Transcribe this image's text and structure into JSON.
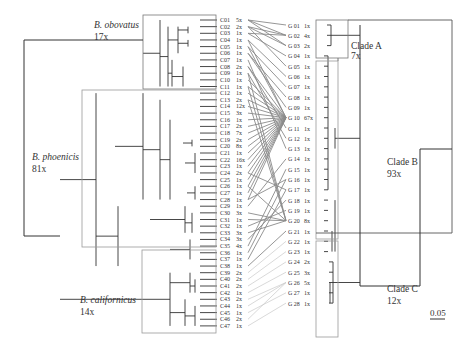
{
  "groups": {
    "obovatus": {
      "name": "B. obovatus",
      "count": "17x"
    },
    "phoenicis": {
      "name": "B. phoenicis",
      "count": "81x"
    },
    "californicus": {
      "name": "B. californicus",
      "count": "14x"
    }
  },
  "clades": {
    "A": {
      "name": "Clade A",
      "count": "7x"
    },
    "B": {
      "name": "Clade B",
      "count": "93x"
    },
    "C": {
      "name": "Clade C",
      "count": "12x"
    }
  },
  "scale_bar": "0.05",
  "c_taxa": [
    {
      "id": "C01",
      "n": "5x"
    },
    {
      "id": "C02",
      "n": "2x"
    },
    {
      "id": "C03",
      "n": "1x"
    },
    {
      "id": "C04",
      "n": "1x"
    },
    {
      "id": "C05",
      "n": "1x"
    },
    {
      "id": "C06",
      "n": "1x"
    },
    {
      "id": "C07",
      "n": "1x"
    },
    {
      "id": "C08",
      "n": "2x"
    },
    {
      "id": "C09",
      "n": "1x"
    },
    {
      "id": "C10",
      "n": "1x"
    },
    {
      "id": "C11",
      "n": "1x"
    },
    {
      "id": "C12",
      "n": "1x"
    },
    {
      "id": "C13",
      "n": "2x"
    },
    {
      "id": "C14",
      "n": "12x"
    },
    {
      "id": "C15",
      "n": "3x"
    },
    {
      "id": "C16",
      "n": "1x"
    },
    {
      "id": "C17",
      "n": "2x"
    },
    {
      "id": "C18",
      "n": "7x"
    },
    {
      "id": "C19",
      "n": "2x"
    },
    {
      "id": "C20",
      "n": "8x"
    },
    {
      "id": "C21",
      "n": "1x"
    },
    {
      "id": "C22",
      "n": "16x"
    },
    {
      "id": "C23",
      "n": "1x"
    },
    {
      "id": "C24",
      "n": "2x"
    },
    {
      "id": "C25",
      "n": "1x"
    },
    {
      "id": "C26",
      "n": "1x"
    },
    {
      "id": "C27",
      "n": "1x"
    },
    {
      "id": "C28",
      "n": "1x"
    },
    {
      "id": "C29",
      "n": "1x"
    },
    {
      "id": "C30",
      "n": "3x"
    },
    {
      "id": "C31",
      "n": "1x"
    },
    {
      "id": "C32",
      "n": "1x"
    },
    {
      "id": "C33",
      "n": "3x"
    },
    {
      "id": "C34",
      "n": "3x"
    },
    {
      "id": "C35",
      "n": "4x"
    },
    {
      "id": "C36",
      "n": "1x"
    },
    {
      "id": "C37",
      "n": "1x"
    },
    {
      "id": "C38",
      "n": "1x"
    },
    {
      "id": "C39",
      "n": "2x"
    },
    {
      "id": "C40",
      "n": "2x"
    },
    {
      "id": "C41",
      "n": "2x"
    },
    {
      "id": "C42",
      "n": "1x"
    },
    {
      "id": "C43",
      "n": "2x"
    },
    {
      "id": "C44",
      "n": "1x"
    },
    {
      "id": "C45",
      "n": "1x"
    },
    {
      "id": "C46",
      "n": "2x"
    },
    {
      "id": "C47",
      "n": "1x"
    }
  ],
  "g_taxa": [
    {
      "id": "G 01",
      "n": "1x"
    },
    {
      "id": "G 02",
      "n": "4x"
    },
    {
      "id": "G 03",
      "n": "2x"
    },
    {
      "id": "G 04",
      "n": "1x"
    },
    {
      "id": "G 05",
      "n": "1x"
    },
    {
      "id": "G 06",
      "n": "1x"
    },
    {
      "id": "G 07",
      "n": "1x"
    },
    {
      "id": "G 08",
      "n": "1x"
    },
    {
      "id": "G 09",
      "n": "1x"
    },
    {
      "id": "G 10",
      "n": "67x"
    },
    {
      "id": "G 11",
      "n": "1x"
    },
    {
      "id": "G 12",
      "n": "1x"
    },
    {
      "id": "G 13",
      "n": "1x"
    },
    {
      "id": "G 14",
      "n": "1x"
    },
    {
      "id": "G 15",
      "n": "1x"
    },
    {
      "id": "G 16",
      "n": "1x"
    },
    {
      "id": "G 17",
      "n": "1x"
    },
    {
      "id": "G 18",
      "n": "1x"
    },
    {
      "id": "G 19",
      "n": "1x"
    },
    {
      "id": "G 20",
      "n": "8x"
    },
    {
      "id": "G 21",
      "n": "1x"
    },
    {
      "id": "G 22",
      "n": "1x"
    },
    {
      "id": "G 23",
      "n": "1x"
    },
    {
      "id": "G 24",
      "n": "2x"
    },
    {
      "id": "G 25",
      "n": "3x"
    },
    {
      "id": "G 26",
      "n": "5x"
    },
    {
      "id": "G 27",
      "n": "1x"
    },
    {
      "id": "G 28",
      "n": "1x"
    }
  ],
  "links": [
    [
      1,
      1
    ],
    [
      1,
      2
    ],
    [
      1,
      3
    ],
    [
      2,
      2
    ],
    [
      2,
      3
    ],
    [
      3,
      2
    ],
    [
      4,
      10
    ],
    [
      5,
      10
    ],
    [
      6,
      9
    ],
    [
      7,
      13
    ],
    [
      8,
      10
    ],
    [
      8,
      11
    ],
    [
      9,
      12
    ],
    [
      10,
      10
    ],
    [
      11,
      10
    ],
    [
      12,
      10
    ],
    [
      13,
      10
    ],
    [
      14,
      10
    ],
    [
      15,
      10
    ],
    [
      16,
      10
    ],
    [
      17,
      10
    ],
    [
      18,
      10
    ],
    [
      19,
      10
    ],
    [
      20,
      10
    ],
    [
      21,
      10
    ],
    [
      22,
      10
    ],
    [
      23,
      10
    ],
    [
      24,
      10
    ],
    [
      25,
      10
    ],
    [
      26,
      10
    ],
    [
      27,
      10
    ],
    [
      28,
      10
    ],
    [
      29,
      14
    ],
    [
      30,
      20
    ],
    [
      31,
      20
    ],
    [
      32,
      19
    ],
    [
      33,
      20
    ],
    [
      34,
      18
    ],
    [
      35,
      15
    ],
    [
      36,
      16
    ],
    [
      37,
      17
    ],
    [
      38,
      21
    ],
    [
      39,
      22
    ],
    [
      40,
      23
    ],
    [
      41,
      24
    ],
    [
      42,
      25
    ],
    [
      43,
      26
    ],
    [
      44,
      26
    ],
    [
      45,
      27
    ],
    [
      46,
      26
    ],
    [
      47,
      28
    ],
    [
      2,
      5
    ],
    [
      3,
      4
    ],
    [
      4,
      6
    ],
    [
      5,
      7
    ],
    [
      6,
      8
    ],
    [
      9,
      20
    ],
    [
      11,
      20
    ],
    [
      13,
      20
    ],
    [
      24,
      17
    ],
    [
      26,
      20
    ],
    [
      28,
      16
    ]
  ]
}
